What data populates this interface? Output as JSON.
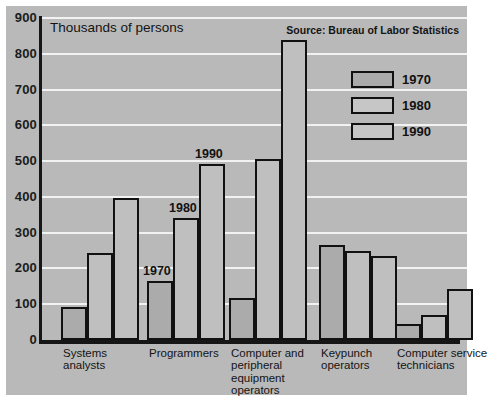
{
  "chart_data": {
    "type": "bar",
    "title": "",
    "axis_note": "Thousands of persons",
    "source": "Source: Bureau of Labor Statistics",
    "xlabel": "",
    "ylabel": "Thousands of persons",
    "ylim": [
      0,
      900
    ],
    "yticks": [
      900,
      800,
      700,
      600,
      500,
      400,
      300,
      200,
      100,
      0
    ],
    "grid": true,
    "legend_position": "top-right",
    "categories": [
      "Systems analysts",
      "Programmers",
      "Computer and peripheral equipment operators",
      "Keypunch operators",
      "Computer service technicians"
    ],
    "category_lines": [
      [
        "Systems",
        "analysts"
      ],
      [
        "Programmers"
      ],
      [
        "Computer and",
        "peripheral",
        "equipment",
        "operators"
      ],
      [
        "Keypunch",
        "operators"
      ],
      [
        "Computer service",
        "technicians"
      ]
    ],
    "series": [
      {
        "name": "1970",
        "values": [
          93,
          165,
          117,
          265,
          45
        ]
      },
      {
        "name": "1980",
        "values": [
          242,
          340,
          505,
          250,
          70
        ]
      },
      {
        "name": "1990",
        "values": [
          397,
          492,
          838,
          235,
          142
        ]
      }
    ],
    "annotations": [
      {
        "text": "1970",
        "category": "Programmers",
        "series": "1970"
      },
      {
        "text": "1980",
        "category": "Programmers",
        "series": "1980"
      },
      {
        "text": "1990",
        "category": "Programmers",
        "series": "1990"
      }
    ],
    "colors": {
      "background": "#b9b9b9",
      "gridline": "#f2f2f2",
      "axis": "#161616",
      "bar_1970_fill": "#ababab",
      "bar_1980_fill": "#bfbfbf",
      "bar_1990_fill": "#bfbfbf",
      "bar_outline": "#111111",
      "text": "#141414",
      "page_border": "#ffffff"
    }
  },
  "legend": {
    "items": [
      {
        "label": "1970"
      },
      {
        "label": "1980"
      },
      {
        "label": "1990"
      }
    ]
  }
}
